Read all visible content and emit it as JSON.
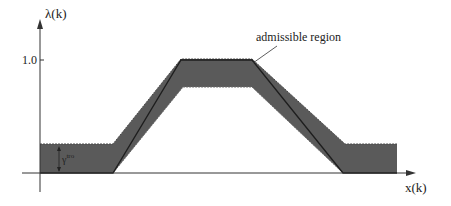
{
  "diagram": {
    "y_axis_label": "λ(k)",
    "x_axis_label": "x(k)",
    "y_tick_label": "1.0",
    "region_label": "admissible region",
    "gamma_label": "γ",
    "gamma_superscript": "tro",
    "colors": {
      "band": "#5a5a5a",
      "axis": "#333333",
      "center_line": "#1e1e1e",
      "background": "#ffffff"
    }
  }
}
